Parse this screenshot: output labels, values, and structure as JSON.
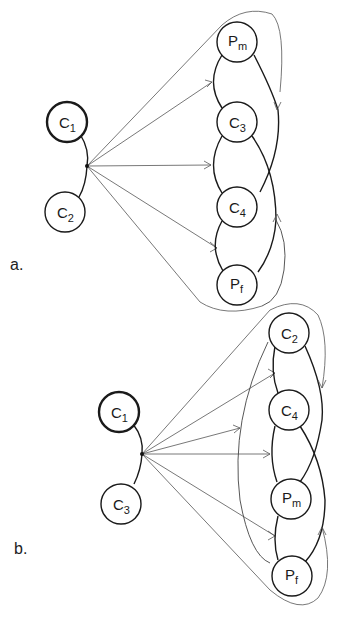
{
  "panels": [
    {
      "label": "a.",
      "left_nodes": [
        {
          "id": "C1",
          "base": "C",
          "sub": "1",
          "thick": true
        },
        {
          "id": "C2",
          "base": "C",
          "sub": "2",
          "thick": false
        }
      ],
      "right_chain": [
        {
          "id": "Pm",
          "base": "P",
          "sub": "m"
        },
        {
          "id": "C3",
          "base": "C",
          "sub": "3"
        },
        {
          "id": "C4",
          "base": "C",
          "sub": "4"
        },
        {
          "id": "Pf",
          "base": "P",
          "sub": "f"
        }
      ]
    },
    {
      "label": "b.",
      "left_nodes": [
        {
          "id": "C1",
          "base": "C",
          "sub": "1",
          "thick": true
        },
        {
          "id": "C3",
          "base": "C",
          "sub": "3",
          "thick": false
        }
      ],
      "right_chain": [
        {
          "id": "C2",
          "base": "C",
          "sub": "2"
        },
        {
          "id": "C4",
          "base": "C",
          "sub": "4"
        },
        {
          "id": "Pm",
          "base": "P",
          "sub": "m"
        },
        {
          "id": "Pf",
          "base": "P",
          "sub": "f"
        }
      ]
    }
  ]
}
